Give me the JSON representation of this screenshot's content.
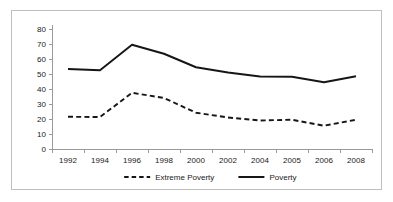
{
  "chart_data": {
    "type": "line",
    "title": "",
    "xlabel": "",
    "ylabel": "",
    "categories": [
      "1992",
      "1994",
      "1996",
      "1998",
      "2000",
      "2002",
      "2004",
      "2005",
      "2006",
      "2008"
    ],
    "ylim": [
      0,
      80
    ],
    "yticks": [
      0,
      10,
      20,
      30,
      40,
      50,
      60,
      70,
      80
    ],
    "grid": false,
    "legend_position": "bottom",
    "series": [
      {
        "name": "Extreme Poverty",
        "style": "dashed",
        "color": "#161616",
        "values": [
          21.5,
          21.3,
          37.5,
          34.0,
          24.2,
          21.0,
          19.0,
          19.5,
          15.5,
          19.5
        ]
      },
      {
        "name": "Poverty",
        "style": "solid",
        "color": "#161616",
        "values": [
          53.3,
          52.5,
          69.5,
          63.5,
          54.5,
          51.0,
          48.3,
          48.2,
          44.5,
          48.5
        ]
      }
    ]
  },
  "legend": {
    "items": [
      {
        "label": "Extreme Poverty",
        "style": "dashed"
      },
      {
        "label": "Poverty",
        "style": "solid"
      }
    ]
  },
  "axes": {
    "y_tick_labels": [
      "80",
      "70",
      "60",
      "50",
      "40",
      "30",
      "20",
      "10",
      "0"
    ],
    "x_tick_labels": [
      "1992",
      "1994",
      "1996",
      "1998",
      "2000",
      "2002",
      "2004",
      "2005",
      "2006",
      "2008"
    ]
  },
  "colors": {
    "line": "#161616",
    "axis": "#9a9a9a",
    "frame": "#bfbfbf",
    "background": "#ffffff",
    "text": "#1a1a1a"
  }
}
